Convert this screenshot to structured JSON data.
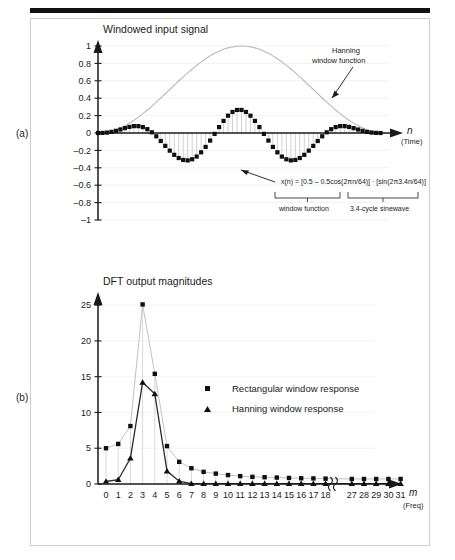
{
  "figure": {
    "panel_a_letter": "(a)",
    "panel_b_letter": "(b)"
  },
  "panel_a": {
    "title": "Windowed input signal",
    "x_axis_name": "n",
    "x_axis_sub": "(Time)",
    "y_ticks": [
      "1",
      "0.8",
      "0.6",
      "0.4",
      "0.2",
      "0",
      "–0.2",
      "–0.4",
      "–0.6",
      "–0.8",
      "–1"
    ],
    "annotation_window_line1": "Hanning",
    "annotation_window_line2": "window function",
    "equation": "x(n) = [0.5 – 0.5cos(2πn/64)] · [sin(2π3.4n/64)]",
    "bracket_left_label": "window function",
    "bracket_right_label": "3.4-cycle sinewave",
    "curve_color": "#b9b9b9",
    "marker_color": "#101010",
    "stem_color": "#bdbdbd"
  },
  "panel_b": {
    "title": "DFT output magnitudes",
    "x_axis_name": "m",
    "x_axis_sub": "(Freq)",
    "y_ticks": [
      "25",
      "20",
      "15",
      "10",
      "5",
      "0"
    ],
    "x_ticks": [
      "0",
      "1",
      "2",
      "3",
      "4",
      "5",
      "6",
      "7",
      "8",
      "9",
      "10",
      "11",
      "12",
      "13",
      "14",
      "15",
      "16",
      "17",
      "18",
      "27",
      "28",
      "29",
      "30",
      "31"
    ],
    "axis_break_symbol": "⦀",
    "legend": [
      {
        "label": "Rectangular window response",
        "marker": "square"
      },
      {
        "label": "Hanning window response",
        "marker": "triangle"
      }
    ],
    "rect_color": "#101010",
    "rect_line_color": "#c2c2c2",
    "hann_color": "#101010",
    "hann_line_color": "#2b2b2b"
  },
  "chart_data": [
    {
      "type": "scatter",
      "id": "panel-a-windowed-input-signal",
      "title": "Windowed input signal",
      "xlabel": "n (Time)",
      "ylabel": "",
      "ylim": [
        -1,
        1
      ],
      "xlim": [
        0,
        64
      ],
      "grid": true,
      "annotations": [
        "Hanning window function",
        "x(n) = [0.5 – 0.5cos(2πn/64)] · [sin(2π3.4n/64)]",
        "window function",
        "3.4-cycle sinewave"
      ],
      "series": [
        {
          "name": "x(n) windowed 3.4-cycle sinewave",
          "marker": "square",
          "x": [
            0,
            1,
            2,
            3,
            4,
            5,
            6,
            7,
            8,
            9,
            10,
            11,
            12,
            13,
            14,
            15,
            16,
            17,
            18,
            19,
            20,
            21,
            22,
            23,
            24,
            25,
            26,
            27,
            28,
            29,
            30,
            31,
            32,
            33,
            34,
            35,
            36,
            37,
            38,
            39,
            40,
            41,
            42,
            43,
            44,
            45,
            46,
            47,
            48,
            49,
            50,
            51,
            52,
            53,
            54,
            55,
            56,
            57,
            58,
            59,
            60,
            61,
            62,
            63
          ],
          "y": [
            0.0,
            0.001,
            0.005,
            0.013,
            0.025,
            0.04,
            0.056,
            0.07,
            0.079,
            0.079,
            0.068,
            0.044,
            0.008,
            -0.038,
            -0.092,
            -0.148,
            -0.203,
            -0.251,
            -0.288,
            -0.31,
            -0.315,
            -0.302,
            -0.271,
            -0.222,
            -0.16,
            -0.087,
            -0.01,
            0.068,
            0.139,
            0.199,
            0.242,
            0.265,
            0.265,
            0.242,
            0.199,
            0.139,
            0.068,
            -0.01,
            -0.087,
            -0.16,
            -0.222,
            -0.271,
            -0.302,
            -0.315,
            -0.31,
            -0.288,
            -0.251,
            -0.203,
            -0.148,
            -0.092,
            -0.038,
            0.008,
            0.044,
            0.068,
            0.079,
            0.079,
            0.07,
            0.056,
            0.04,
            0.025,
            0.013,
            0.005,
            0.001,
            0.0
          ]
        },
        {
          "name": "Hanning window function",
          "marker": "line",
          "x": [
            0,
            4,
            8,
            12,
            16,
            20,
            24,
            28,
            32,
            36,
            40,
            44,
            48,
            52,
            56,
            60,
            64
          ],
          "y": [
            0.0,
            0.038,
            0.146,
            0.309,
            0.5,
            0.691,
            0.854,
            0.962,
            1.0,
            0.962,
            0.854,
            0.691,
            0.5,
            0.309,
            0.146,
            0.038,
            0.0
          ]
        }
      ]
    },
    {
      "type": "line",
      "id": "panel-b-dft-output-magnitudes",
      "title": "DFT output magnitudes",
      "xlabel": "m (Freq)",
      "ylabel": "",
      "ylim": [
        0,
        26
      ],
      "grid": true,
      "categories": [
        "0",
        "1",
        "2",
        "3",
        "4",
        "5",
        "6",
        "7",
        "8",
        "9",
        "10",
        "11",
        "12",
        "13",
        "14",
        "15",
        "16",
        "17",
        "18",
        "27",
        "28",
        "29",
        "30",
        "31"
      ],
      "series": [
        {
          "name": "Rectangular window response",
          "marker": "square",
          "values": [
            5.0,
            5.6,
            8.1,
            25.1,
            15.4,
            5.3,
            3.1,
            2.2,
            1.7,
            1.45,
            1.25,
            1.1,
            1.0,
            0.95,
            0.9,
            0.85,
            0.8,
            0.78,
            0.75,
            0.7,
            0.7,
            0.7,
            0.7,
            0.7
          ]
        },
        {
          "name": "Hanning window response",
          "marker": "triangle",
          "values": [
            0.35,
            0.6,
            3.6,
            14.2,
            12.6,
            1.8,
            0.4,
            0.05,
            0.05,
            0.05,
            0.05,
            0.05,
            0.05,
            0.05,
            0.05,
            0.05,
            0.05,
            0.05,
            0.05,
            0.05,
            0.05,
            0.05,
            0.05,
            0.05
          ]
        }
      ]
    }
  ]
}
